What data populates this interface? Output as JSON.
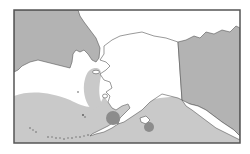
{
  "map": {
    "kind": "regional map",
    "region": "Alaska and Bering Sea",
    "colors": {
      "background": "#ffffff",
      "frame": "#555555",
      "foreign_land": "#b3b3b3",
      "land": "#ffffff",
      "coastline": "#555555",
      "shaded_ocean": "#c9c9c9",
      "unshaded_ocean": "#ffffff",
      "marker": "#8c8c8c"
    },
    "markers": [
      {
        "id": "marker-large",
        "cx": 113,
        "cy": 118,
        "r": 7
      },
      {
        "id": "marker-small",
        "cx": 149,
        "cy": 127,
        "r": 5
      }
    ]
  }
}
